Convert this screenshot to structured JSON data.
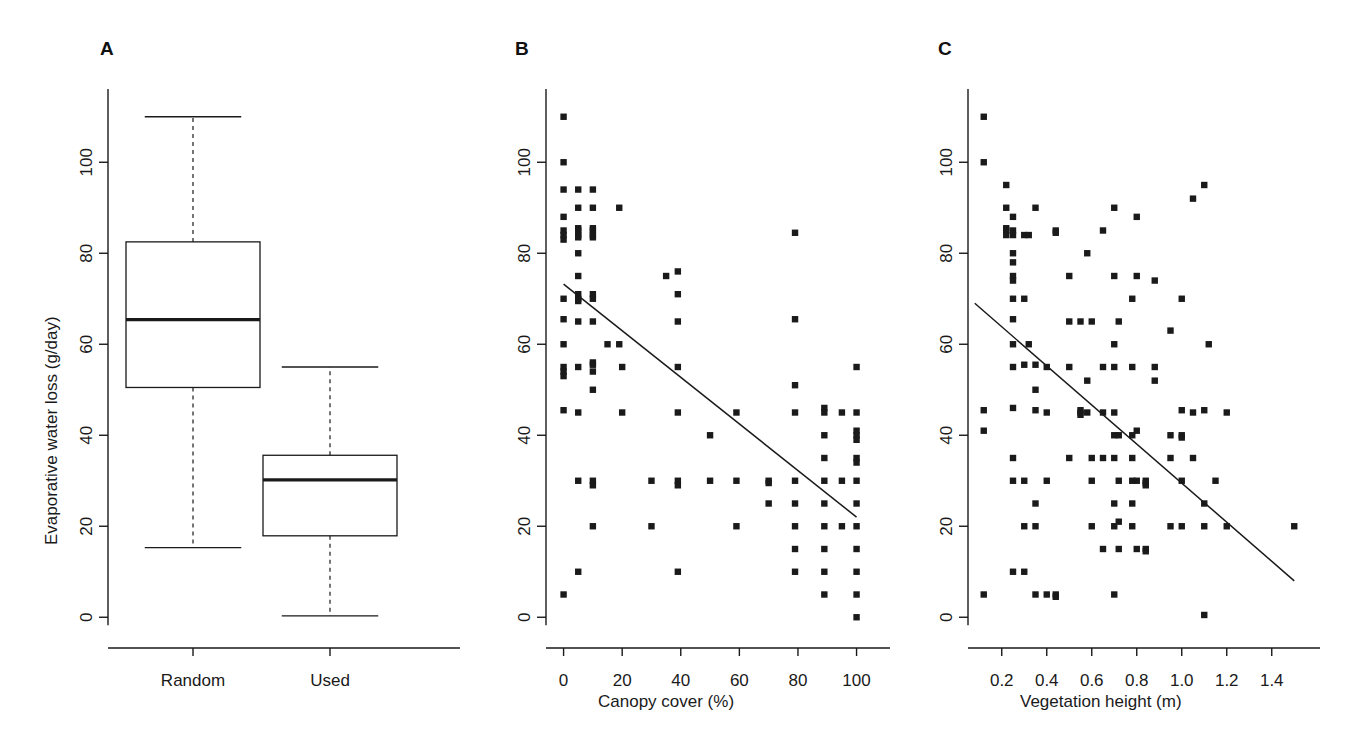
{
  "figure": {
    "background": "#ffffff",
    "ink": "#1a1a1a",
    "panels": [
      "A",
      "B",
      "C"
    ]
  },
  "labels": {
    "panel_a": "A",
    "panel_b": "B",
    "panel_c": "C",
    "ylabel": "Evaporative water loss (g/day)",
    "xlabel_b": "Canopy cover (%)",
    "xlabel_c": "Vegetation height (m)",
    "category_random": "Random",
    "category_used": "Used"
  },
  "chart_data": [
    {
      "type": "box",
      "panel": "A",
      "title": "A",
      "xlabel": "",
      "ylabel": "Evaporative water loss (g/day)",
      "ylim": [
        -5,
        115
      ],
      "yticks": [
        0,
        20,
        40,
        60,
        80,
        100
      ],
      "ytick_labels": [
        "0",
        "20",
        "40",
        "60",
        "80",
        "100"
      ],
      "grid": false,
      "categories": [
        "Random",
        "Used"
      ],
      "boxes": [
        {
          "name": "Random",
          "whisker_low": 15.3,
          "q1": 50.5,
          "median": 65.4,
          "q3": 82.5,
          "whisker_high": 110.0
        },
        {
          "name": "Used",
          "whisker_low": 0.3,
          "q1": 17.9,
          "median": 30.2,
          "q3": 35.6,
          "whisker_high": 55.0
        }
      ]
    },
    {
      "type": "scatter",
      "panel": "B",
      "title": "B",
      "xlabel": "Canopy cover (%)",
      "ylabel": "",
      "xlim": [
        -6,
        108
      ],
      "ylim": [
        -5,
        115
      ],
      "xticks": [
        0,
        20,
        40,
        60,
        80,
        100
      ],
      "xtick_labels": [
        "0",
        "20",
        "40",
        "60",
        "80",
        "100"
      ],
      "yticks": [
        0,
        20,
        40,
        60,
        80,
        100
      ],
      "ytick_labels": [
        "0",
        "20",
        "40",
        "60",
        "80",
        "100"
      ],
      "grid": false,
      "marker": "square",
      "fit_line": {
        "x0": 0,
        "y0": 73.2,
        "x1": 100,
        "y1": 22.0
      },
      "points": [
        [
          0,
          110
        ],
        [
          0,
          100
        ],
        [
          0,
          94
        ],
        [
          0,
          88
        ],
        [
          0,
          85
        ],
        [
          0,
          84
        ],
        [
          0,
          83
        ],
        [
          0,
          70
        ],
        [
          0,
          65.5
        ],
        [
          0,
          60
        ],
        [
          0,
          55
        ],
        [
          0,
          54
        ],
        [
          0,
          53
        ],
        [
          0,
          45.5
        ],
        [
          0,
          5
        ],
        [
          5,
          94
        ],
        [
          5,
          90
        ],
        [
          5,
          85.5
        ],
        [
          5,
          85
        ],
        [
          5,
          84
        ],
        [
          5,
          83.5
        ],
        [
          5,
          80
        ],
        [
          5,
          75
        ],
        [
          5,
          71
        ],
        [
          5,
          70
        ],
        [
          5,
          69.5
        ],
        [
          5,
          65
        ],
        [
          5,
          55
        ],
        [
          5,
          45
        ],
        [
          5,
          30
        ],
        [
          5,
          10
        ],
        [
          10,
          94
        ],
        [
          10,
          90
        ],
        [
          10,
          85.5
        ],
        [
          10,
          85
        ],
        [
          10,
          84
        ],
        [
          10,
          83.5
        ],
        [
          10,
          71
        ],
        [
          10,
          70
        ],
        [
          10,
          65
        ],
        [
          10,
          56
        ],
        [
          10,
          55.5
        ],
        [
          10,
          54
        ],
        [
          10,
          50
        ],
        [
          10,
          30
        ],
        [
          10,
          29
        ],
        [
          10,
          20
        ],
        [
          15,
          60
        ],
        [
          19,
          90
        ],
        [
          19,
          60
        ],
        [
          20,
          55
        ],
        [
          20,
          45
        ],
        [
          30,
          30
        ],
        [
          30,
          20
        ],
        [
          35,
          75
        ],
        [
          39,
          76
        ],
        [
          39,
          71
        ],
        [
          39,
          65
        ],
        [
          39,
          55
        ],
        [
          39,
          45
        ],
        [
          39,
          30
        ],
        [
          39,
          29
        ],
        [
          39,
          10
        ],
        [
          50,
          40
        ],
        [
          50,
          30
        ],
        [
          59,
          45
        ],
        [
          59,
          30
        ],
        [
          59,
          20
        ],
        [
          70,
          30
        ],
        [
          70,
          29.5
        ],
        [
          70,
          25
        ],
        [
          79,
          84.5
        ],
        [
          79,
          65.5
        ],
        [
          79,
          51
        ],
        [
          79,
          45
        ],
        [
          79,
          30
        ],
        [
          79,
          25
        ],
        [
          79,
          20
        ],
        [
          79,
          15
        ],
        [
          79,
          10
        ],
        [
          89,
          46
        ],
        [
          89,
          45
        ],
        [
          89,
          40
        ],
        [
          89,
          35
        ],
        [
          89,
          30
        ],
        [
          89,
          25
        ],
        [
          89,
          20
        ],
        [
          89,
          15
        ],
        [
          89,
          10
        ],
        [
          89,
          5
        ],
        [
          95,
          45
        ],
        [
          95,
          30
        ],
        [
          95,
          20
        ],
        [
          100,
          55
        ],
        [
          100,
          45
        ],
        [
          100,
          41
        ],
        [
          100,
          40
        ],
        [
          100,
          39
        ],
        [
          100,
          35
        ],
        [
          100,
          34
        ],
        [
          100,
          30
        ],
        [
          100,
          25
        ],
        [
          100,
          20
        ],
        [
          100,
          15
        ],
        [
          100,
          10
        ],
        [
          100,
          5
        ],
        [
          100,
          0
        ]
      ]
    },
    {
      "type": "scatter",
      "panel": "C",
      "title": "C",
      "xlabel": "Vegetation height (m)",
      "ylabel": "",
      "xlim": [
        0.05,
        1.57
      ],
      "ylim": [
        -5,
        115
      ],
      "xticks": [
        0.2,
        0.4,
        0.6,
        0.8,
        1.0,
        1.2,
        1.4
      ],
      "xtick_labels": [
        "0.2",
        "0.4",
        "0.6",
        "0.8",
        "1.0",
        "1.2",
        "1.4"
      ],
      "yticks": [
        0,
        20,
        40,
        60,
        80,
        100
      ],
      "ytick_labels": [
        "0",
        "20",
        "40",
        "60",
        "80",
        "100"
      ],
      "grid": false,
      "marker": "square",
      "fit_line": {
        "x0": 0.08,
        "y0": 69.0,
        "x1": 1.5,
        "y1": 8.0
      },
      "points": [
        [
          0.12,
          110
        ],
        [
          0.12,
          100
        ],
        [
          0.12,
          45.5
        ],
        [
          0.12,
          41
        ],
        [
          0.12,
          5
        ],
        [
          0.22,
          95
        ],
        [
          0.22,
          90
        ],
        [
          0.22,
          85.5
        ],
        [
          0.22,
          85
        ],
        [
          0.22,
          84
        ],
        [
          0.25,
          88
        ],
        [
          0.25,
          85
        ],
        [
          0.25,
          84
        ],
        [
          0.25,
          80
        ],
        [
          0.25,
          78
        ],
        [
          0.25,
          75
        ],
        [
          0.25,
          74
        ],
        [
          0.25,
          70
        ],
        [
          0.25,
          65.5
        ],
        [
          0.25,
          60
        ],
        [
          0.25,
          55
        ],
        [
          0.25,
          46
        ],
        [
          0.25,
          35
        ],
        [
          0.25,
          30
        ],
        [
          0.25,
          10
        ],
        [
          0.3,
          84
        ],
        [
          0.3,
          70
        ],
        [
          0.3,
          55.5
        ],
        [
          0.3,
          30
        ],
        [
          0.3,
          20
        ],
        [
          0.3,
          10
        ],
        [
          0.32,
          60
        ],
        [
          0.32,
          84
        ],
        [
          0.35,
          90
        ],
        [
          0.35,
          55.5
        ],
        [
          0.35,
          50
        ],
        [
          0.35,
          45.5
        ],
        [
          0.35,
          25
        ],
        [
          0.35,
          20
        ],
        [
          0.35,
          5
        ],
        [
          0.4,
          55
        ],
        [
          0.4,
          45
        ],
        [
          0.4,
          30
        ],
        [
          0.4,
          5
        ],
        [
          0.44,
          85
        ],
        [
          0.44,
          84.5
        ],
        [
          0.44,
          5
        ],
        [
          0.44,
          4.5
        ],
        [
          0.5,
          75
        ],
        [
          0.5,
          65
        ],
        [
          0.5,
          55
        ],
        [
          0.5,
          35
        ],
        [
          0.55,
          65
        ],
        [
          0.55,
          45.5
        ],
        [
          0.55,
          45
        ],
        [
          0.55,
          44.5
        ],
        [
          0.58,
          80
        ],
        [
          0.58,
          52
        ],
        [
          0.58,
          45
        ],
        [
          0.6,
          65
        ],
        [
          0.6,
          35
        ],
        [
          0.6,
          30
        ],
        [
          0.6,
          20
        ],
        [
          0.65,
          85
        ],
        [
          0.65,
          55
        ],
        [
          0.65,
          45
        ],
        [
          0.65,
          35
        ],
        [
          0.65,
          15
        ],
        [
          0.7,
          90
        ],
        [
          0.7,
          75
        ],
        [
          0.7,
          60
        ],
        [
          0.7,
          55
        ],
        [
          0.7,
          45
        ],
        [
          0.7,
          40
        ],
        [
          0.7,
          35
        ],
        [
          0.7,
          25
        ],
        [
          0.7,
          20
        ],
        [
          0.7,
          5
        ],
        [
          0.72,
          65
        ],
        [
          0.72,
          40
        ],
        [
          0.72,
          30
        ],
        [
          0.72,
          21
        ],
        [
          0.72,
          15
        ],
        [
          0.78,
          70
        ],
        [
          0.78,
          55
        ],
        [
          0.78,
          40
        ],
        [
          0.78,
          35
        ],
        [
          0.78,
          30
        ],
        [
          0.78,
          25
        ],
        [
          0.78,
          20
        ],
        [
          0.8,
          88
        ],
        [
          0.8,
          75
        ],
        [
          0.8,
          41
        ],
        [
          0.8,
          30
        ],
        [
          0.8,
          15
        ],
        [
          0.84,
          30
        ],
        [
          0.84,
          29.5
        ],
        [
          0.84,
          29
        ],
        [
          0.84,
          15
        ],
        [
          0.84,
          14.5
        ],
        [
          0.88,
          74
        ],
        [
          0.88,
          55
        ],
        [
          0.88,
          52
        ],
        [
          0.95,
          63
        ],
        [
          0.95,
          40
        ],
        [
          0.95,
          35
        ],
        [
          0.95,
          20
        ],
        [
          1.0,
          70
        ],
        [
          1.0,
          45.5
        ],
        [
          1.0,
          40
        ],
        [
          1.0,
          39.5
        ],
        [
          1.0,
          30
        ],
        [
          1.0,
          20
        ],
        [
          1.05,
          92
        ],
        [
          1.05,
          45
        ],
        [
          1.05,
          35
        ],
        [
          1.1,
          95
        ],
        [
          1.1,
          45.5
        ],
        [
          1.1,
          25
        ],
        [
          1.1,
          20
        ],
        [
          1.1,
          0.5
        ],
        [
          1.12,
          60
        ],
        [
          1.15,
          30
        ],
        [
          1.2,
          45
        ],
        [
          1.2,
          20
        ],
        [
          1.5,
          20
        ]
      ]
    }
  ]
}
